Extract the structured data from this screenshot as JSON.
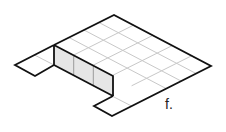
{
  "figure": {
    "label": "f.",
    "grid": {
      "rows": 4,
      "cols": 5
    },
    "wall_faces": 3,
    "flaps": 2,
    "colors": {
      "outline": "#111111",
      "grid": "#c8c8c8",
      "wall_fill": "#e6e6e6",
      "background": "#ffffff"
    }
  }
}
